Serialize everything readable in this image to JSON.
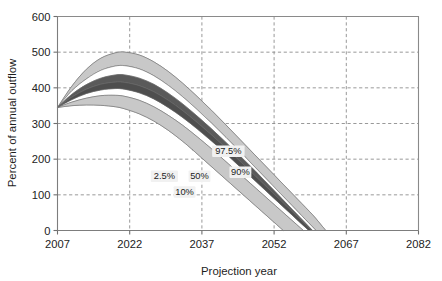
{
  "chart_data": {
    "type": "area",
    "title": "",
    "xlabel": "Projection year",
    "ylabel": "Percent of annual outflow",
    "xlim": [
      2007,
      2082
    ],
    "ylim": [
      0,
      600
    ],
    "xticks": [
      2007,
      2022,
      2037,
      2052,
      2067,
      2082
    ],
    "yticks": [
      0,
      100,
      200,
      300,
      400,
      500,
      600
    ],
    "grid": "dashed-both-axes",
    "legend": "inline-annotations",
    "start_point": {
      "x": 2007,
      "y": 345
    },
    "annotations": [
      {
        "label": "97.5%",
        "x": 2042.5,
        "y": 222
      },
      {
        "label": "90%",
        "x": 2045.0,
        "y": 163
      },
      {
        "label": "50%",
        "x": 2036.5,
        "y": 152
      },
      {
        "label": "10%",
        "x": 2033.4,
        "y": 108
      },
      {
        "label": "2.5%",
        "x": 2029.2,
        "y": 152
      }
    ],
    "series": [
      {
        "name": "97.5%",
        "role": "upper-outer",
        "shade": "light",
        "x": [
          2007,
          2010,
          2013,
          2016,
          2019,
          2021,
          2024,
          2027,
          2030,
          2033,
          2036,
          2039,
          2042,
          2045,
          2048,
          2051,
          2054,
          2057,
          2060,
          2062
        ],
        "values": [
          345,
          405,
          452,
          483,
          498,
          500,
          492,
          473,
          446,
          413,
          376,
          337,
          296,
          254,
          212,
          170,
          128,
          86,
          44,
          12
        ]
      },
      {
        "name": "90%",
        "role": "upper",
        "shade": "light",
        "x": [
          2007,
          2010,
          2013,
          2016,
          2019,
          2021,
          2024,
          2027,
          2030,
          2033,
          2036,
          2039,
          2042,
          2045,
          2048,
          2051,
          2054,
          2056
        ],
        "values": [
          345,
          392,
          425,
          449,
          461,
          462,
          453,
          434,
          407,
          375,
          339,
          301,
          261,
          220,
          178,
          136,
          94,
          66
        ]
      },
      {
        "name": "75%",
        "role": "upper-inner",
        "shade": "dark",
        "x": [
          2007,
          2010,
          2013,
          2016,
          2019,
          2021,
          2024,
          2027,
          2030,
          2033,
          2036,
          2039,
          2042,
          2045,
          2048,
          2050
        ],
        "values": [
          345,
          382,
          409,
          427,
          436,
          436,
          427,
          410,
          385,
          355,
          321,
          285,
          247,
          208,
          168,
          140
        ]
      },
      {
        "name": "50%",
        "role": "median",
        "shade": "dark",
        "x": [
          2007,
          2010,
          2013,
          2016,
          2019,
          2021,
          2024,
          2027,
          2030,
          2033,
          2036,
          2039,
          2042,
          2045,
          2047
        ],
        "values": [
          345,
          374,
          396,
          410,
          416,
          415,
          406,
          389,
          365,
          336,
          303,
          268,
          231,
          193,
          167
        ]
      },
      {
        "name": "25%",
        "role": "lower-inner",
        "shade": "dark",
        "x": [
          2007,
          2010,
          2013,
          2016,
          2019,
          2021,
          2024,
          2027,
          2030,
          2033,
          2036,
          2039,
          2042,
          2044
        ],
        "values": [
          345,
          367,
          384,
          394,
          398,
          396,
          386,
          369,
          345,
          317,
          285,
          251,
          215,
          190
        ]
      },
      {
        "name": "10%",
        "role": "lower",
        "shade": "light",
        "x": [
          2007,
          2010,
          2013,
          2016,
          2019,
          2021,
          2024,
          2027,
          2030,
          2033,
          2036,
          2039,
          2041
        ],
        "values": [
          345,
          360,
          371,
          378,
          379,
          376,
          365,
          347,
          323,
          295,
          263,
          229,
          205
        ]
      },
      {
        "name": "2.5%",
        "role": "lower-outer",
        "shade": "light",
        "x": [
          2007,
          2010,
          2013,
          2016,
          2019,
          2021,
          2024,
          2027,
          2030,
          2033,
          2035,
          2037
        ],
        "values": [
          345,
          350,
          352,
          351,
          347,
          341,
          327,
          307,
          281,
          250,
          227,
          203
        ]
      }
    ],
    "colors": {
      "band_light": "#c8c8c8",
      "band_dark": "#5a5a5a",
      "band_white": "#ffffff",
      "axis": "#7d7d7d",
      "grid": "#8d8d8d",
      "text": "#1a1a1a",
      "callout_bg": "#f1f1f1"
    }
  }
}
